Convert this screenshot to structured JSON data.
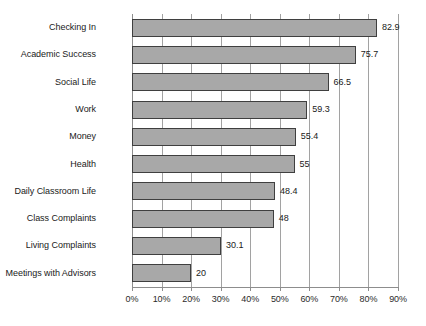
{
  "chart_data": {
    "type": "bar",
    "orientation": "horizontal",
    "title": "",
    "subtitle": "",
    "xlabel": "",
    "ylabel": "",
    "xlim": [
      0,
      90
    ],
    "xtick_labels": [
      "0%",
      "10%",
      "20%",
      "30%",
      "40%",
      "50%",
      "60%",
      "70%",
      "80%",
      "90%"
    ],
    "xticks": [
      0,
      10,
      20,
      30,
      40,
      50,
      60,
      70,
      80,
      90
    ],
    "grid": "vertical",
    "legend": "none",
    "value_labels": true,
    "categories": [
      "Checking In",
      "Academic Success",
      "Social Life",
      "Work",
      "Money",
      "Health",
      "Daily Classroom Life",
      "Class Complaints",
      "Living Complaints",
      "Meetings with Advisors"
    ],
    "values": [
      82.9,
      75.7,
      66.5,
      59.3,
      55.4,
      55,
      48.4,
      48,
      30.1,
      20
    ],
    "value_label_texts": [
      "82.9",
      "75.7",
      "66.5",
      "59.3",
      "55.4",
      "55",
      "48.4",
      "48",
      "30.1",
      "20"
    ],
    "colors": {
      "bar_fill": "#a8a8a8",
      "bar_border": "#3f3f3f",
      "gridline": "#a2a2a2",
      "axis": "#8d8d8d",
      "text": "#1a1a1a",
      "background": "#ffffff"
    }
  }
}
